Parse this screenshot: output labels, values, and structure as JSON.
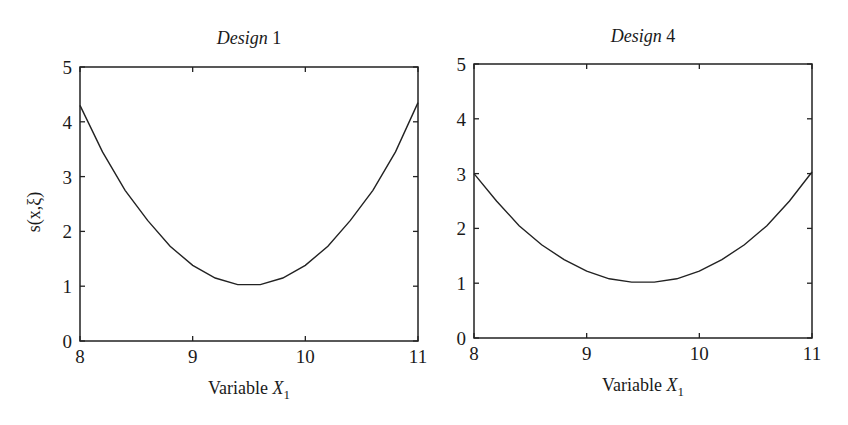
{
  "figure": {
    "ylabel": "s(x,ξ)",
    "panels": [
      {
        "title_italic": "Design",
        "title_num": " 1",
        "xlabel": "Variable ",
        "xlabel_var": "X",
        "xlabel_sub": "1"
      },
      {
        "title_italic": "Design",
        "title_num": " 4",
        "xlabel": "Variable ",
        "xlabel_var": "X",
        "xlabel_sub": "1"
      }
    ]
  },
  "chart_data": [
    {
      "type": "line",
      "title": "Design 1",
      "xlabel": "Variable X1",
      "ylabel": "s(x,ξ)",
      "xlim": [
        8,
        11
      ],
      "ylim": [
        0,
        5
      ],
      "xticks": [
        8,
        9,
        10,
        11
      ],
      "yticks": [
        0,
        1,
        2,
        3,
        4,
        5
      ],
      "grid": false,
      "x": [
        8.0,
        8.2,
        8.4,
        8.6,
        8.8,
        9.0,
        9.2,
        9.4,
        9.6,
        9.8,
        10.0,
        10.2,
        10.4,
        10.6,
        10.8,
        11.0
      ],
      "series": [
        {
          "name": "s(x,ξ)",
          "values": [
            4.3,
            3.45,
            2.75,
            2.2,
            1.73,
            1.38,
            1.15,
            1.03,
            1.03,
            1.15,
            1.38,
            1.73,
            2.2,
            2.75,
            3.45,
            4.35
          ]
        }
      ]
    },
    {
      "type": "line",
      "title": "Design 4",
      "xlabel": "Variable X1",
      "ylabel": "",
      "xlim": [
        8,
        11
      ],
      "ylim": [
        0,
        5
      ],
      "xticks": [
        8,
        9,
        10,
        11
      ],
      "yticks": [
        0,
        1,
        2,
        3,
        4,
        5
      ],
      "grid": false,
      "x": [
        8.0,
        8.2,
        8.4,
        8.6,
        8.8,
        9.0,
        9.2,
        9.4,
        9.6,
        9.8,
        10.0,
        10.2,
        10.4,
        10.6,
        10.8,
        11.0
      ],
      "series": [
        {
          "name": "s(x,ξ)",
          "values": [
            3.0,
            2.5,
            2.05,
            1.7,
            1.43,
            1.22,
            1.08,
            1.02,
            1.02,
            1.08,
            1.22,
            1.43,
            1.7,
            2.05,
            2.5,
            3.03
          ]
        }
      ]
    }
  ]
}
